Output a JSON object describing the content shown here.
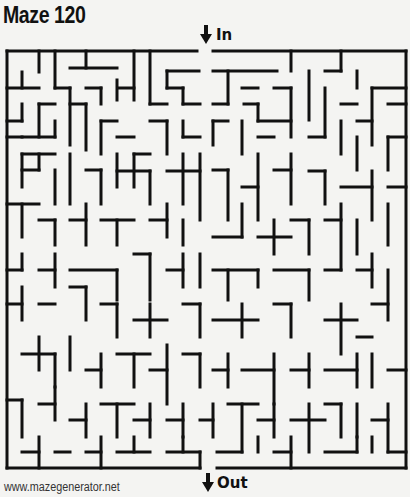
{
  "title": "Maze 120",
  "entrance": {
    "label": "In",
    "icon": "arrow-down-icon"
  },
  "exit": {
    "label": "Out",
    "icon": "arrow-down-icon"
  },
  "footer": "www.mazegenerator.net",
  "maze": {
    "cols": 24,
    "rows": 25,
    "origin": [
      7,
      51
    ],
    "cell": [
      16.6,
      16.7
    ],
    "wall_color": "#111111",
    "background": "#f4f4f2"
  }
}
